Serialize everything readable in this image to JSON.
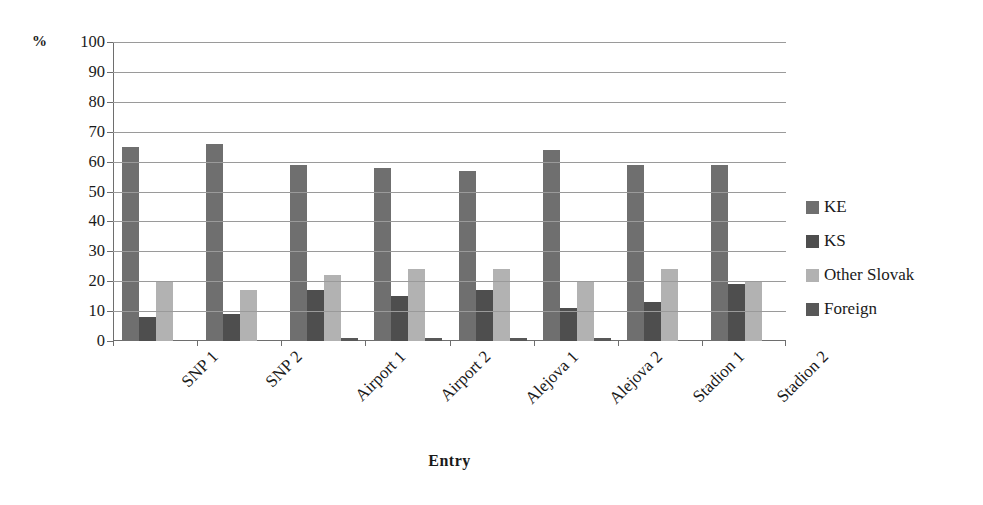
{
  "chart_data": {
    "type": "bar",
    "title": "",
    "subtitle": "",
    "xlabel": "Entry",
    "ylabel": "%",
    "unit_label": "%",
    "ylim": [
      0,
      100
    ],
    "ytick_step": 10,
    "yticks": [
      100,
      90,
      80,
      70,
      60,
      50,
      40,
      30,
      20,
      10,
      0
    ],
    "grid": true,
    "grid_axis": "y",
    "legend_position": "right",
    "orientation": "vertical",
    "grouping": "grouped",
    "categories": [
      "SNP 1",
      "SNP 2",
      "Airport 1",
      "Airport 2",
      "Alejova 1",
      "Alejova 2",
      "Stadion 1",
      "Stadion 2"
    ],
    "series": [
      {
        "name": "KE",
        "color": "#6f6f6f",
        "values": [
          65,
          66,
          59,
          58,
          57,
          64,
          59,
          59
        ]
      },
      {
        "name": "KS",
        "color": "#4e4e4e",
        "values": [
          8,
          9,
          17,
          15,
          17,
          11,
          13,
          19
        ]
      },
      {
        "name": "Other Slovak",
        "color": "#b2b2b2",
        "values": [
          20,
          17,
          22,
          24,
          24,
          20,
          24,
          20
        ]
      },
      {
        "name": "Foreign",
        "color": "#585858",
        "values": [
          0,
          0,
          1,
          1,
          1,
          1,
          0,
          0
        ]
      }
    ]
  },
  "axis": {
    "y_unit": "%",
    "x_title": "Entry"
  },
  "colors": {
    "series_ke": "#6f6f6f",
    "series_ks": "#4e4e4e",
    "series_other_slovak": "#b2b2b2",
    "series_foreign": "#585858",
    "gridline": "#9a9a9a",
    "axis": "#6e6e6e",
    "text": "#1a1a1a",
    "background": "#ffffff"
  }
}
